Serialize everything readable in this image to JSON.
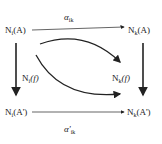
{
  "diagram": {
    "type": "commutative-diagram",
    "nodes": {
      "top_left": {
        "text": "N",
        "sub": "i",
        "arg": "(A)"
      },
      "top_right": {
        "text": "N",
        "sub": "k",
        "arg": "(A)"
      },
      "bottom_left": {
        "text": "N",
        "sub": "i",
        "arg": "(A')"
      },
      "bottom_right": {
        "text": "N",
        "sub": "k",
        "arg": "(A')"
      }
    },
    "arrows": {
      "top": {
        "label": "α",
        "label_sub": "ik"
      },
      "bottom": {
        "label": "α'",
        "label_sub": "ik"
      },
      "left": {
        "label": "N",
        "label_sub": "i",
        "label_arg": "(f)"
      },
      "right": {
        "label": "N",
        "label_sub": "k",
        "label_arg": "(f)"
      }
    },
    "colors": {
      "stroke": "#222222",
      "text": "#333333"
    }
  }
}
